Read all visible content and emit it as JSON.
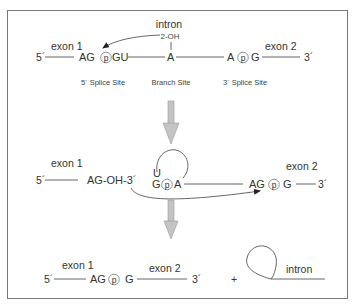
{
  "diagram": {
    "border_color": "#777777",
    "arrow_color": "#b5b5b5",
    "step1": {
      "intron_label": "intron",
      "oh_label": "2-OH",
      "five_prime": "5´",
      "three_prime": "3´",
      "exon1_label": "exon 1",
      "exon2_label": "exon 2",
      "seq_5ss_left": "AG",
      "seq_5ss_right": "GU",
      "seq_branch": "A",
      "seq_3ss_left": "A",
      "seq_3ss_right": "G",
      "phosphate": "p",
      "caption_5ss": "5´ Splice Site",
      "caption_branch": "Branch Site",
      "caption_3ss": "3´ Splice Site"
    },
    "step2": {
      "exon1_label": "exon 1",
      "exon2_label": "exon 2",
      "five_prime": "5´",
      "three_prime": "3´",
      "free_end": "AG-OH-3´",
      "lariat_u": "U",
      "lariat_g": "G",
      "lariat_a": "A",
      "seq_3ss_left": "AG",
      "seq_3ss_right": "G",
      "phosphate": "p"
    },
    "step3": {
      "exon1_label": "exon 1",
      "exon2_label": "exon 2",
      "five_prime": "5´",
      "three_prime": "3´",
      "seq_left": "AG",
      "seq_right": "G",
      "phosphate": "p",
      "plus": "+",
      "intron_label": "intron"
    }
  }
}
